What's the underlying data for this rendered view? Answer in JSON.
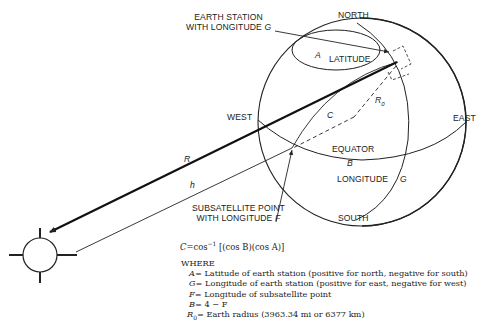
{
  "diagram": {
    "labels": {
      "earth_station_line1": "EARTH STATION",
      "earth_station_line2": "WITH LONGITUDE",
      "earth_station_var": "G",
      "north": "NORTH",
      "south": "SOUTH",
      "east": "EAST",
      "west": "WEST",
      "latitude": "LATITUDE",
      "latitude_var": "A",
      "equator": "EQUATOR",
      "equator_var": "B",
      "longitude": "LONGITUDE",
      "longitude_var": "G",
      "radius_var": "R",
      "radius_sub": "0",
      "central_angle_var": "C",
      "range_var": "R",
      "height_var": "h",
      "subsat_line1": "SUBSATELLITE POINT",
      "subsat_line2": "WITH LONGITUDE",
      "subsat_var": "F"
    },
    "icons": {
      "satellite": "satellite-icon",
      "globe": "globe-icon"
    },
    "colors": {
      "ink": "#222222",
      "background": "#ffffff"
    }
  },
  "equation": {
    "lhs": "C",
    "eq": "=",
    "func": "cos",
    "exp": "−1",
    "rhs": "[(cos B)(cos A)]"
  },
  "legend": {
    "heading": "WHERE",
    "items": [
      {
        "var": "A",
        "sub": "",
        "text": "= Latitude of earth station (positive for north, negative for south)"
      },
      {
        "var": "G",
        "sub": "",
        "text": "= Longitude of earth station (positive for east, negative for west)"
      },
      {
        "var": "F",
        "sub": "",
        "text": "= Longitude of subsatellite point"
      },
      {
        "var": "B",
        "sub": "",
        "text": "= 4 − F"
      },
      {
        "var": "R",
        "sub": "0",
        "text": "= Earth radius (3963.34 mi or 6377 km)"
      }
    ]
  }
}
